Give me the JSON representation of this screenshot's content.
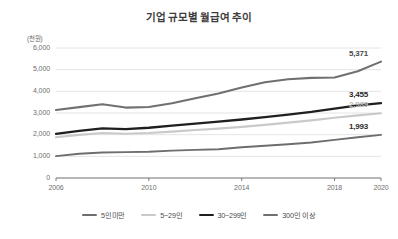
{
  "chart_data": {
    "type": "line",
    "title": "기업 규모별 월급여 추이",
    "xlabel": "",
    "ylabel": "(천원)",
    "unit_note": "(천원)",
    "grid": true,
    "legend_position": "bottom",
    "x": [
      2006,
      2007,
      2008,
      2009,
      2010,
      2011,
      2012,
      2013,
      2014,
      2015,
      2016,
      2017,
      2018,
      2019,
      2020
    ],
    "xticks": [
      "2006",
      "2010",
      "2014",
      "2018",
      "2020"
    ],
    "xtick_values": [
      2006,
      2010,
      2014,
      2018,
      2020
    ],
    "yticks": [
      "0",
      "1,000",
      "2,000",
      "3,000",
      "4,000",
      "5,000",
      "6,000"
    ],
    "ytick_values": [
      0,
      1000,
      2000,
      3000,
      4000,
      5000,
      6000
    ],
    "ylim": [
      0,
      6000
    ],
    "xlim": [
      2006,
      2020
    ],
    "series": [
      {
        "name": "5인미만",
        "color": "#6e6e6e",
        "width": 1.9,
        "values": [
          1010,
          1120,
          1175,
          1195,
          1215,
          1265,
          1300,
          1330,
          1420,
          1490,
          1560,
          1640,
          1760,
          1880,
          1993
        ],
        "end_label": "1,993",
        "end_label_color": "#2b2b2b"
      },
      {
        "name": "5~29인",
        "color": "#c9c9c9",
        "width": 2.1,
        "values": [
          1880,
          1990,
          2075,
          2040,
          2075,
          2140,
          2215,
          2280,
          2360,
          2450,
          2555,
          2660,
          2780,
          2890,
          2989
        ],
        "end_label": "2,989",
        "end_label_color": "#b5b5b5"
      },
      {
        "name": "30~299인",
        "color": "#1f1f1f",
        "width": 2.3,
        "values": [
          2040,
          2180,
          2290,
          2260,
          2320,
          2420,
          2510,
          2600,
          2700,
          2810,
          2930,
          3050,
          3200,
          3350,
          3455
        ],
        "end_label": "3,455",
        "end_label_color": "#1f1f1f"
      },
      {
        "name": "300인 이상",
        "color": "#707070",
        "width": 2.1,
        "values": [
          3140,
          3270,
          3400,
          3250,
          3280,
          3450,
          3680,
          3900,
          4180,
          4420,
          4560,
          4620,
          4640,
          4930,
          5371
        ],
        "end_label": "5,371",
        "end_label_color": "#4a4a4a"
      }
    ],
    "colors": {
      "grid": "#e4e4e4",
      "axis": "#6e6e6e",
      "title": "#3c3c3c",
      "tick_text": "#6e6e6e"
    }
  }
}
